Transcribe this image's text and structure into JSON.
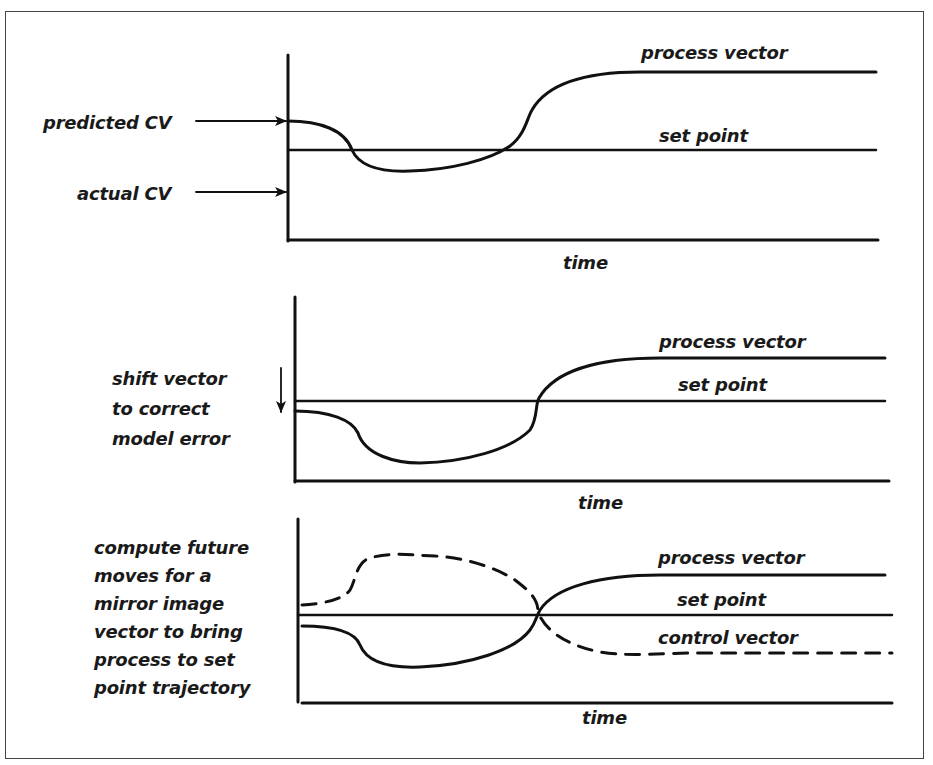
{
  "panels": [
    {
      "id": "panel-1",
      "labels": {
        "predicted": "predicted CV",
        "actual": "actual CV",
        "process_vector": "process vector",
        "set_point": "set point",
        "x_axis": "time"
      }
    },
    {
      "id": "panel-2",
      "labels": {
        "annotation": "shift vector\nto correct\nmodel error",
        "process_vector": "process vector",
        "set_point": "set point",
        "x_axis": "time"
      }
    },
    {
      "id": "panel-3",
      "labels": {
        "annotation": "compute future\nmoves for a\nmirror image\nvector to bring\nprocess to set\npoint trajectory",
        "process_vector": "process vector",
        "set_point": "set point",
        "control_vector": "control vector",
        "x_axis": "time"
      }
    }
  ],
  "icons": {
    "arrow_right": "right-arrow",
    "arrow_down": "down-arrow"
  },
  "colors": {
    "line": "#111111",
    "border": "#444444",
    "background": "#ffffff"
  }
}
